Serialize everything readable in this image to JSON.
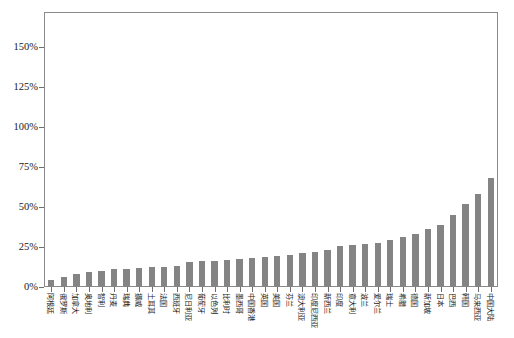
{
  "chart_data": {
    "type": "bar",
    "title": "",
    "subtitle": "",
    "xlabel": "",
    "ylabel": "",
    "ylim": [
      0,
      171
    ],
    "grid": false,
    "legend": null,
    "bar_color": "#848484",
    "axis_color": "#8a8a8a",
    "y_ticks": [
      0,
      25,
      50,
      75,
      100,
      125,
      150
    ],
    "y_tick_labels": [
      "0%",
      "25%",
      "50%",
      "75%",
      "100%",
      "125%",
      "150%"
    ],
    "categories": [
      "阿根廷",
      "俄罗斯",
      "加拿大",
      "奥地利",
      "智利",
      "丹麦",
      "瑞典",
      "挪威",
      "土耳其",
      "法国",
      "西班牙",
      "尼日利亚",
      "葡萄牙",
      "以色列",
      "比利时",
      "墨西哥",
      "中国香港",
      "英国",
      "美国",
      "芬兰",
      "澳大利亚",
      "印度尼西亚",
      "新西兰",
      "印度",
      "意大利",
      "波兰",
      "爱尔兰",
      "瑞士",
      "希腊",
      "德国",
      "新加坡",
      "日本",
      "巴西",
      "韩国",
      "马来西亚",
      "中国大陆"
    ],
    "values": [
      4.5,
      6.5,
      8.0,
      9.5,
      9.8,
      11.0,
      11.2,
      12.0,
      12.2,
      12.5,
      13.0,
      15.5,
      16.0,
      16.5,
      17.0,
      17.5,
      18.0,
      19.0,
      19.5,
      20.0,
      21.0,
      22.0,
      23.0,
      25.5,
      26.0,
      27.0,
      27.5,
      29.5,
      31.0,
      33.0,
      36.0,
      39.0,
      45.0,
      52.0,
      58.0,
      68.0
    ]
  }
}
